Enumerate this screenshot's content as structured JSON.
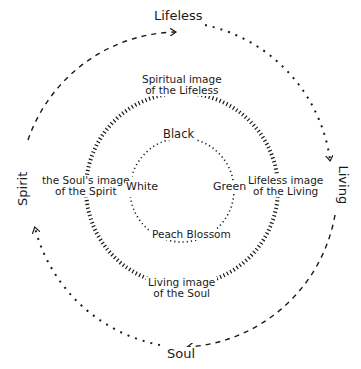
{
  "colors": {
    "ink": "#1a1a1a",
    "background": "#ffffff"
  },
  "diagram": {
    "outer_circle": {
      "style": "dashed with arrows",
      "labels": {
        "top": "Lifeless",
        "right": "Living",
        "bottom": "Soul",
        "left": "Spirit"
      }
    },
    "middle_circle": {
      "style": "hatched",
      "labels": {
        "top": [
          "Spiritual image",
          "of the Lifeless"
        ],
        "right": [
          "Lifeless image",
          "of the Living"
        ],
        "bottom": [
          "Living image",
          "of the Soul"
        ],
        "left": [
          "the Soul's image",
          "of the Spirit"
        ]
      }
    },
    "inner_circle": {
      "style": "dotted",
      "labels": {
        "top": "Black",
        "right": "Green",
        "bottom": "Peach Blossom",
        "left": "White"
      }
    }
  }
}
